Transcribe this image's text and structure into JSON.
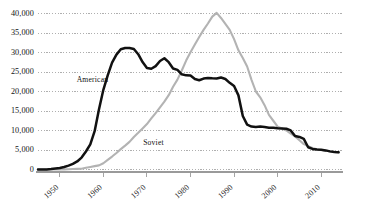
{
  "chart_data": {
    "type": "line",
    "title": "",
    "subtitle": "",
    "xlabel": "",
    "ylabel": "",
    "xlim": [
      1945,
      2015
    ],
    "ylim": [
      0,
      40000
    ],
    "grid": true,
    "grid_axis": "y",
    "legend": "inline-annotations",
    "x_ticks": [
      1950,
      1960,
      1970,
      1980,
      1990,
      2000,
      2010
    ],
    "x_tick_labels": [
      "1950",
      "1960",
      "1970",
      "1980",
      "1990",
      "2000",
      "2010"
    ],
    "y_ticks": [
      0,
      5000,
      10000,
      15000,
      20000,
      25000,
      30000,
      35000,
      40000
    ],
    "y_tick_labels": [
      "0",
      "5,000",
      "10,000",
      "15,000",
      "20,000",
      "25,000",
      "30,000",
      "35,000",
      "40,000"
    ],
    "annotations": [
      {
        "text": "American",
        "x": 1957.5,
        "y": 22500
      },
      {
        "text": "Soviet",
        "x": 1971.5,
        "y": 6200
      }
    ],
    "series": [
      {
        "name": "American",
        "color": "#111111",
        "width": 2.5,
        "x": [
          1945,
          1946,
          1947,
          1948,
          1949,
          1950,
          1951,
          1952,
          1953,
          1954,
          1955,
          1956,
          1957,
          1958,
          1959,
          1960,
          1961,
          1962,
          1963,
          1964,
          1965,
          1966,
          1967,
          1968,
          1969,
          1970,
          1971,
          1972,
          1973,
          1974,
          1975,
          1976,
          1977,
          1978,
          1979,
          1980,
          1981,
          1982,
          1983,
          1984,
          1985,
          1986,
          1987,
          1988,
          1989,
          1990,
          1991,
          1992,
          1993,
          1994,
          1995,
          1996,
          1997,
          1998,
          1999,
          2000,
          2001,
          2002,
          2003,
          2004,
          2005,
          2006,
          2007,
          2008,
          2009,
          2010,
          2011,
          2012,
          2013,
          2014
        ],
        "y": [
          6,
          11,
          32,
          110,
          235,
          369,
          640,
          1005,
          1436,
          2063,
          3057,
          4618,
          6444,
          9822,
          15468,
          20434,
          24111,
          27387,
          29459,
          30817,
          31139,
          31175,
          30895,
          29561,
          27552,
          26008,
          25830,
          26516,
          27835,
          28537,
          27519,
          25914,
          25542,
          24418,
          24138,
          24104,
          23208,
          22886,
          23305,
          23459,
          23368,
          23317,
          23575,
          23205,
          22217,
          21392,
          19008,
          13708,
          11511,
          11016,
          10904,
          11011,
          10903,
          10732,
          10685,
          10577,
          10526,
          10457,
          10027,
          8570,
          8360,
          7853,
          5709,
          5273,
          5113,
          5066,
          4897,
          4650,
          4500,
          4400
        ]
      },
      {
        "name": "Soviet",
        "color": "#b3b3b3",
        "width": 2.1,
        "x": [
          1945,
          1949,
          1950,
          1951,
          1952,
          1953,
          1954,
          1955,
          1956,
          1957,
          1958,
          1959,
          1960,
          1961,
          1962,
          1963,
          1964,
          1965,
          1966,
          1967,
          1968,
          1969,
          1970,
          1971,
          1972,
          1973,
          1974,
          1975,
          1976,
          1977,
          1978,
          1979,
          1980,
          1981,
          1982,
          1983,
          1984,
          1985,
          1986,
          1987,
          1988,
          1989,
          1990,
          1991,
          1992,
          1993,
          1994,
          1995,
          1996,
          1997,
          1998,
          1999,
          2000,
          2001,
          2002,
          2003,
          2004,
          2005,
          2006,
          2007,
          2008,
          2009,
          2010,
          2011,
          2012,
          2013,
          2014
        ],
        "y": [
          0,
          1,
          5,
          25,
          50,
          120,
          150,
          200,
          426,
          660,
          869,
          1060,
          1605,
          2471,
          3322,
          4238,
          5221,
          6129,
          7089,
          8339,
          9399,
          10538,
          11643,
          13092,
          14478,
          15915,
          17385,
          19055,
          21205,
          23044,
          25393,
          27935,
          30062,
          32049,
          33952,
          35804,
          37431,
          39197,
          40159,
          38859,
          37333,
          35805,
          33417,
          30562,
          28595,
          26400,
          23000,
          20000,
          18500,
          16500,
          14000,
          12500,
          11000,
          10500,
          10000,
          9200,
          8500,
          7500,
          6500,
          6000,
          5500,
          5200,
          5000,
          4850,
          4650,
          4500,
          4400
        ]
      }
    ]
  },
  "axis": {
    "y_axis_name": "warhead-count-axis",
    "x_axis_name": "year-axis"
  }
}
